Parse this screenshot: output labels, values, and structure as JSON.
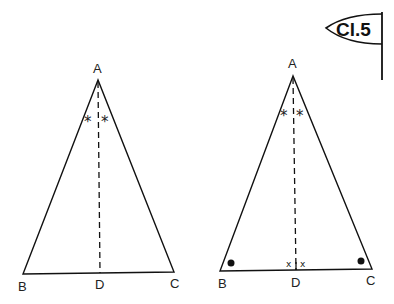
{
  "flag": {
    "label": "Cl.5"
  },
  "figures": [
    {
      "name": "triangle-left",
      "vertices": {
        "A": "A",
        "B": "B",
        "C": "C",
        "D": "D"
      },
      "angle_marks": [
        "*",
        "*"
      ]
    },
    {
      "name": "triangle-right",
      "vertices": {
        "A": "A",
        "B": "B",
        "C": "C",
        "D": "D"
      },
      "angle_marks": [
        "*",
        "*"
      ],
      "foot_marks": [
        "x",
        "x"
      ],
      "base_angle_marks": [
        "dot",
        "dot"
      ]
    }
  ]
}
